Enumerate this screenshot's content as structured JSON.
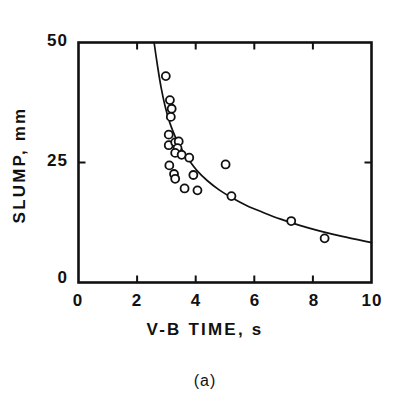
{
  "figure": {
    "caption": "(a)",
    "style": "scanned-line-art"
  },
  "colors": {
    "ink": "#111111",
    "background": "#ffffff"
  },
  "chart_data": {
    "type": "scatter",
    "title": "",
    "subtitle": "",
    "caption": "(a)",
    "xlabel": "V-B TIME, s",
    "ylabel": "SLUMP, mm",
    "xlim": [
      0,
      10
    ],
    "ylim": [
      0,
      50
    ],
    "xticks": [
      0,
      2,
      4,
      6,
      8,
      10
    ],
    "xtick_labels": [
      "0",
      "2",
      "4",
      "6",
      "8",
      "10"
    ],
    "yticks": [
      0,
      25,
      50
    ],
    "ytick_labels": [
      "0",
      "25",
      "50"
    ],
    "grid": false,
    "legend": null,
    "marker": "open-circle",
    "frame": "box",
    "tick_direction": "in",
    "series": [
      {
        "name": "measurements",
        "marker": "open-circle",
        "points": [
          [
            2.98,
            43.0
          ],
          [
            3.12,
            38.0
          ],
          [
            3.18,
            36.2
          ],
          [
            3.15,
            34.5
          ],
          [
            3.08,
            30.8
          ],
          [
            3.08,
            28.6
          ],
          [
            3.3,
            29.2
          ],
          [
            3.42,
            29.4
          ],
          [
            3.38,
            28.0
          ],
          [
            3.3,
            27.0
          ],
          [
            3.52,
            26.6
          ],
          [
            3.78,
            26.0
          ],
          [
            3.1,
            24.4
          ],
          [
            3.26,
            22.6
          ],
          [
            3.3,
            21.6
          ],
          [
            3.92,
            22.4
          ],
          [
            3.62,
            19.6
          ],
          [
            4.06,
            19.2
          ],
          [
            5.02,
            24.6
          ],
          [
            5.22,
            18.0
          ],
          [
            7.26,
            12.8
          ],
          [
            8.4,
            9.2
          ]
        ]
      }
    ],
    "fit_curve": {
      "name": "fitted-curve",
      "style": "solid",
      "points": [
        [
          2.58,
          50.0
        ],
        [
          2.7,
          45.0
        ],
        [
          2.82,
          40.6
        ],
        [
          2.96,
          36.6
        ],
        [
          3.12,
          33.2
        ],
        [
          3.3,
          30.4
        ],
        [
          3.52,
          27.8
        ],
        [
          3.78,
          25.4
        ],
        [
          4.06,
          23.2
        ],
        [
          4.4,
          21.2
        ],
        [
          4.8,
          19.3
        ],
        [
          5.25,
          17.6
        ],
        [
          5.75,
          16.0
        ],
        [
          6.3,
          14.6
        ],
        [
          6.9,
          13.2
        ],
        [
          7.55,
          11.9
        ],
        [
          8.25,
          10.7
        ],
        [
          9.0,
          9.6
        ],
        [
          10.0,
          8.3
        ]
      ]
    }
  }
}
